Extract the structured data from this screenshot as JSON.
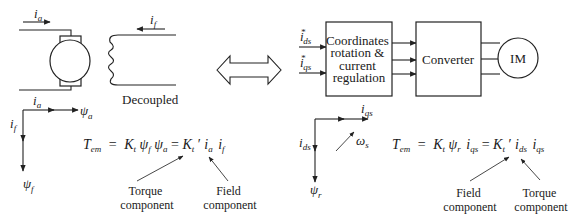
{
  "dc_machine": {
    "armature_current": "i",
    "armature_current_sub": "a",
    "field_current": "i",
    "field_current_sub": "f",
    "coupling_label": "Decoupled",
    "vectors": {
      "ia": "i",
      "ia_sub": "a",
      "psia": "ψ",
      "psia_sub": "a",
      "if": "i",
      "if_sub": "f",
      "psif": "ψ",
      "psif_sub": "f"
    },
    "equation": {
      "lhs": "T",
      "lhs_sub": "em",
      "eq1": "=",
      "k": "K",
      "k_sub": "t",
      "psi_f": "ψ",
      "psi_f_sub": "f",
      "psi_a": "ψ",
      "psi_a_sub": "a",
      "eq2": "=",
      "k2": "K",
      "k2_sub": "t",
      "prime": "′",
      "ia": "i",
      "ia_sub": "a",
      "if": "i",
      "if_sub": "f"
    },
    "annotations": {
      "torque_line1": "Torque",
      "torque_line2": "component",
      "field_line1": "Field",
      "field_line2": "component"
    }
  },
  "equivalence_arrow": "double-arrow-icon",
  "im_drive": {
    "inputs": [
      {
        "symbol": "i",
        "sup": "*",
        "sub": "ds"
      },
      {
        "symbol": "i",
        "sup": "*",
        "sub": "qs"
      }
    ],
    "block1": [
      "Coordinates",
      "rotation &",
      "current",
      "regulation"
    ],
    "block2": "Converter",
    "motor": "IM",
    "vectors": {
      "iqs": "i",
      "iqs_sub": "qs",
      "ids": "i",
      "ids_sub": "ds",
      "psir": "ψ",
      "psir_sub": "r",
      "omega": "ω",
      "omega_sub": "s"
    },
    "equation": {
      "lhs": "T",
      "lhs_sub": "em",
      "eq1": "=",
      "k": "K",
      "k_sub": "t",
      "psi_r": "ψ",
      "psi_r_sub": "r",
      "iqs": "i",
      "iqs_sub": "qs",
      "eq2": "=",
      "k2": "K",
      "k2_sub": "t",
      "prime": "′",
      "ids": "i",
      "ids_sub": "ds",
      "iqs2": "i",
      "iqs2_sub": "qs"
    },
    "annotations": {
      "field_line1": "Field",
      "field_line2": "component",
      "torque_line1": "Torque",
      "torque_line2": "component"
    }
  }
}
